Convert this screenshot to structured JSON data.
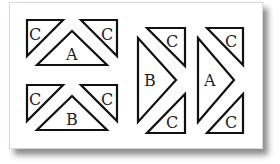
{
  "diagram": {
    "colors": {
      "background": "#ffffff",
      "stroke": "#111111",
      "text": "#222222"
    },
    "groups": [
      {
        "id": "horizontal-A",
        "orientation": "up",
        "center_label": "A",
        "corner_labels": [
          "C",
          "C"
        ]
      },
      {
        "id": "horizontal-B",
        "orientation": "up",
        "center_label": "B",
        "corner_labels": [
          "C",
          "C"
        ]
      },
      {
        "id": "vertical-B",
        "orientation": "right",
        "center_label": "B",
        "corner_labels": [
          "C",
          "C"
        ]
      },
      {
        "id": "vertical-A",
        "orientation": "right",
        "center_label": "A",
        "corner_labels": [
          "C",
          "C"
        ]
      }
    ]
  }
}
